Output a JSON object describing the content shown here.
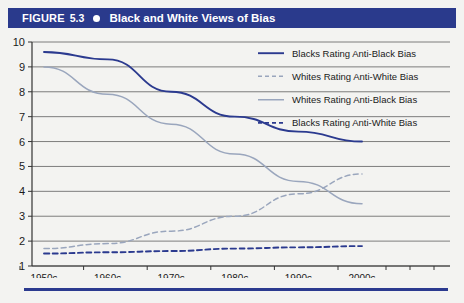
{
  "header": {
    "figure_label": "FIGURE",
    "figure_number": "5.3",
    "bullet_icon": "bullet-dot-icon",
    "title": "Black and White Views of Bias",
    "bar_color": "#2a3a8c"
  },
  "colors": {
    "navy": "#2b3a8f",
    "light_blue": "#9aa6bd",
    "background": "#f3f3f1",
    "gridline": "#6f6f6f",
    "text": "#1a1a1a"
  },
  "chart_data": {
    "type": "line",
    "title": "Black and White Views of Bias",
    "xlabel": "",
    "ylabel": "",
    "x": [
      "1950s",
      "1960s",
      "1970s",
      "1980s",
      "1990s",
      "2000s"
    ],
    "ylim": [
      1,
      10
    ],
    "yticks": [
      1,
      2,
      3,
      4,
      5,
      6,
      7,
      8,
      9,
      10
    ],
    "xticklabels": [
      "1950s",
      "1960s",
      "1970s",
      "1980s",
      "1990s",
      "2000s"
    ],
    "grid": true,
    "legend_position": "top-right",
    "series": [
      {
        "name": "Blacks Rating Anti-Black Bias",
        "color": "#2b3a8f",
        "style": "solid",
        "values": [
          9.6,
          9.3,
          8.0,
          7.0,
          6.4,
          6.0
        ]
      },
      {
        "name": "Whites Rating Anti-White Bias",
        "color": "#9aa6bd",
        "style": "dashed",
        "values": [
          1.7,
          1.9,
          2.4,
          3.0,
          3.9,
          4.7
        ]
      },
      {
        "name": "Whites Rating Anti-Black Bias",
        "color": "#9aa6bd",
        "style": "solid",
        "values": [
          9.0,
          7.9,
          6.7,
          5.5,
          4.4,
          3.5
        ]
      },
      {
        "name": "Blacks Rating Anti-White Bias",
        "color": "#2b3a8f",
        "style": "dashed",
        "values": [
          1.5,
          1.55,
          1.6,
          1.7,
          1.75,
          1.8
        ]
      }
    ]
  },
  "legend": {
    "items": [
      {
        "label": "Blacks Rating Anti-Black Bias",
        "color": "#2b3a8f",
        "style": "solid"
      },
      {
        "label": "Whites Rating Anti-White Bias",
        "color": "#9aa6bd",
        "style": "dashed"
      },
      {
        "label": "Whites Rating Anti-Black Bias",
        "color": "#9aa6bd",
        "style": "solid"
      },
      {
        "label": "Blacks Rating Anti-White Bias",
        "color": "#2b3a8f",
        "style": "dashed"
      }
    ]
  }
}
